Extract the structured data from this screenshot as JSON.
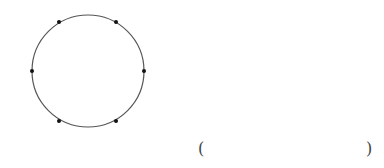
{
  "diagram": {
    "type": "circle-with-points",
    "circle": {
      "cx": 88,
      "cy": 71,
      "r": 56,
      "stroke": "#555555"
    },
    "points": [
      {
        "name": "top-left",
        "x": 59,
        "y": 22
      },
      {
        "name": "top-right",
        "x": 116,
        "y": 22
      },
      {
        "name": "left",
        "x": 32,
        "y": 71
      },
      {
        "name": "right",
        "x": 144,
        "y": 71
      },
      {
        "name": "bottom-left",
        "x": 59,
        "y": 121
      },
      {
        "name": "bottom-right",
        "x": 116,
        "y": 121
      }
    ],
    "point_color": "#111111"
  },
  "answer": {
    "open": "(",
    "close": ")"
  }
}
